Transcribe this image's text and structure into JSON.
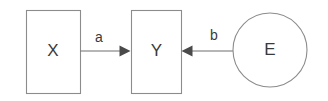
{
  "diagram": {
    "type": "causal-path-diagram",
    "background_color": "#ffffff",
    "stroke_color": "#8c8c8c",
    "edge_color": "#6e6e6e",
    "arrowhead_color": "#4a4a4a",
    "text_color": "#3a3a3a",
    "nodes": [
      {
        "id": "X",
        "label": "X",
        "shape": "rectangle",
        "x": 26,
        "y": 10,
        "width": 54,
        "height": 83,
        "center_x": 53,
        "center_y": 51.5
      },
      {
        "id": "Y",
        "label": "Y",
        "shape": "rectangle",
        "x": 131,
        "y": 10,
        "width": 50,
        "height": 83,
        "center_x": 156,
        "center_y": 51.5
      },
      {
        "id": "E",
        "label": "E",
        "shape": "circle",
        "center_x": 270,
        "center_y": 50,
        "radius": 37
      }
    ],
    "edges": [
      {
        "id": "a",
        "label": "a",
        "from": "X",
        "to": "Y",
        "direction": "right",
        "x1": 80,
        "x2": 131,
        "y": 51,
        "label_x": 99,
        "label_y": 38
      },
      {
        "id": "b",
        "label": "b",
        "from": "E",
        "to": "Y",
        "direction": "left",
        "x1": 233,
        "x2": 181,
        "y": 51,
        "label_x": 214,
        "label_y": 36
      }
    ]
  }
}
